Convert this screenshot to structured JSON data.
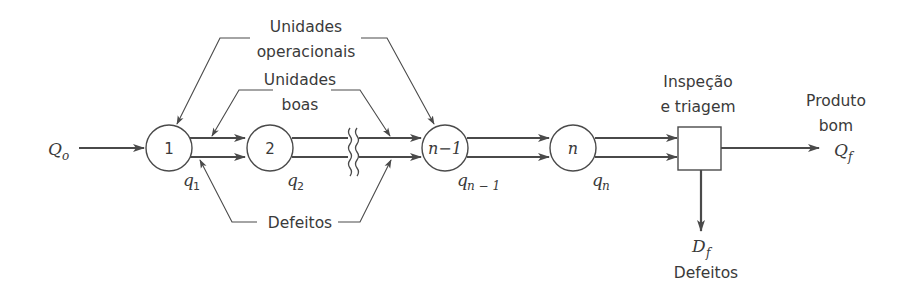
{
  "diagram": {
    "type": "serial production line with inspection",
    "colors": {
      "line": "#4a4a4a",
      "text": "#3a3a3a",
      "background": "#ffffff"
    },
    "input": {
      "symbol": "Q",
      "subscript": "o"
    },
    "nodes": [
      {
        "id": "1",
        "label": "1",
        "yield_symbol": "q",
        "yield_subscript": "1"
      },
      {
        "id": "2",
        "label": "2",
        "yield_symbol": "q",
        "yield_subscript": "2"
      },
      {
        "id": "n-1",
        "label": "n−1",
        "yield_symbol": "q",
        "yield_subscript": "n − 1"
      },
      {
        "id": "n",
        "label": "n",
        "yield_symbol": "q",
        "yield_subscript": "n"
      }
    ],
    "annotations": {
      "operational_units": [
        "Unidades",
        "operacionais"
      ],
      "good_units": [
        "Unidades",
        "boas"
      ],
      "defects": "Defeitos"
    },
    "inspection": {
      "label_line1": "Inspeção",
      "label_line2": "e triagem"
    },
    "output_good": {
      "label_line1": "Produto",
      "label_line2": "bom",
      "symbol": "Q",
      "subscript": "f"
    },
    "output_defects": {
      "symbol": "D",
      "subscript": "f",
      "label": "Defeitos"
    }
  }
}
